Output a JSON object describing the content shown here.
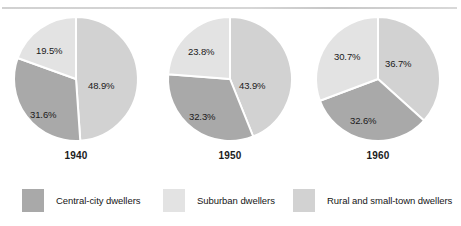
{
  "figure": {
    "name": "urban-population-pie-charts",
    "top_rule_visible": true
  },
  "colors": {
    "central_city": "#a9a9a9",
    "suburban": "#e3e3e3",
    "rural": "#d2d2d2",
    "slice_divider": "#ffffff",
    "text": "#1a1a1a",
    "background": "#ffffff"
  },
  "legend": {
    "items": [
      {
        "label": "Central-city dwellers",
        "color": "#a9a9a9",
        "key": "central_city"
      },
      {
        "label": "Suburban dwellers",
        "color": "#e3e3e3",
        "key": "suburban"
      },
      {
        "label": "Rural and small-town dwellers",
        "color": "#d2d2d2",
        "key": "rural"
      }
    ]
  },
  "charts": [
    {
      "year": "1940",
      "slices": [
        {
          "key": "rural",
          "label": "48.9%",
          "value": 48.9,
          "color": "#d2d2d2"
        },
        {
          "key": "central_city",
          "label": "31.6%",
          "value": 31.6,
          "color": "#a9a9a9"
        },
        {
          "key": "suburban",
          "label": "19.5%",
          "value": 19.5,
          "color": "#e3e3e3"
        }
      ]
    },
    {
      "year": "1950",
      "slices": [
        {
          "key": "rural",
          "label": "43.9%",
          "value": 43.9,
          "color": "#d2d2d2"
        },
        {
          "key": "central_city",
          "label": "32.3%",
          "value": 32.3,
          "color": "#a9a9a9"
        },
        {
          "key": "suburban",
          "label": "23.8%",
          "value": 23.8,
          "color": "#e3e3e3"
        }
      ]
    },
    {
      "year": "1960",
      "slices": [
        {
          "key": "rural",
          "label": "36.7%",
          "value": 36.7,
          "color": "#d2d2d2"
        },
        {
          "key": "central_city",
          "label": "32.6%",
          "value": 32.6,
          "color": "#a9a9a9"
        },
        {
          "key": "suburban",
          "label": "30.7%",
          "value": 30.7,
          "color": "#e3e3e3"
        }
      ]
    }
  ],
  "chart_data": {
    "type": "pie",
    "title": "",
    "subtitle": "",
    "xlabel": "",
    "ylabel": "",
    "grid": false,
    "legend_position": "bottom",
    "units": "percent",
    "panels": [
      {
        "name": "1940",
        "categories": [
          "Rural and small-town dwellers",
          "Central-city dwellers",
          "Suburban dwellers"
        ],
        "values": [
          48.9,
          31.6,
          19.5
        ],
        "labels": [
          "48.9%",
          "31.6%",
          "19.5%"
        ],
        "start_angle_deg": 0,
        "direction": "clockwise"
      },
      {
        "name": "1950",
        "categories": [
          "Rural and small-town dwellers",
          "Central-city dwellers",
          "Suburban dwellers"
        ],
        "values": [
          43.9,
          32.3,
          23.8
        ],
        "labels": [
          "43.9%",
          "32.3%",
          "23.8%"
        ],
        "start_angle_deg": 0,
        "direction": "clockwise"
      },
      {
        "name": "1960",
        "categories": [
          "Rural and small-town dwellers",
          "Central-city dwellers",
          "Suburban dwellers"
        ],
        "values": [
          36.7,
          32.6,
          30.7
        ],
        "labels": [
          "36.7%",
          "32.6%",
          "30.7%"
        ],
        "start_angle_deg": 0,
        "direction": "clockwise"
      }
    ],
    "series": [
      {
        "name": "Rural and small-town dwellers",
        "values": [
          48.9,
          43.9,
          36.7
        ],
        "color": "#d2d2d2"
      },
      {
        "name": "Central-city dwellers",
        "values": [
          31.6,
          32.3,
          32.6
        ],
        "color": "#a9a9a9"
      },
      {
        "name": "Suburban dwellers",
        "values": [
          19.5,
          23.8,
          30.7
        ],
        "color": "#e3e3e3"
      }
    ],
    "panel_names": [
      "1940",
      "1950",
      "1960"
    ]
  }
}
